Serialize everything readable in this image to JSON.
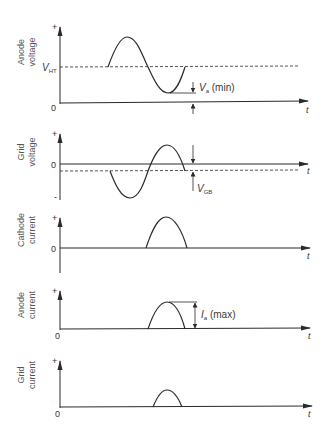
{
  "colors": {
    "line": "#2a2a2a",
    "text": "#3a3a3a",
    "background": "#ffffff"
  },
  "panels": [
    {
      "id": "anode-voltage",
      "ylabel_line1": "Anode",
      "ylabel_line2": "voltage",
      "plus": "+",
      "zero": "0",
      "t": "t",
      "ref_label": "V",
      "ref_sub": "HT",
      "annotation": "V",
      "annotation_sub": "a",
      "annotation_suffix": " (min)"
    },
    {
      "id": "grid-voltage",
      "ylabel_line1": "Grid",
      "ylabel_line2": "voltage",
      "plus": "+",
      "zero": "0",
      "minus": "-",
      "t": "t",
      "annotation": "V",
      "annotation_sub": "GB"
    },
    {
      "id": "cathode-current",
      "ylabel_line1": "Cathode",
      "ylabel_line2": "current",
      "plus": "+",
      "zero": "0",
      "t": "t"
    },
    {
      "id": "anode-current",
      "ylabel_line1": "Anode",
      "ylabel_line2": "current",
      "plus": "+",
      "zero": "0",
      "t": "t",
      "annotation": "I",
      "annotation_sub": "a",
      "annotation_suffix": " (max)"
    },
    {
      "id": "grid-current",
      "ylabel_line1": "Grid",
      "ylabel_line2": "current",
      "plus": "+",
      "zero": "0",
      "t": "t"
    }
  ]
}
